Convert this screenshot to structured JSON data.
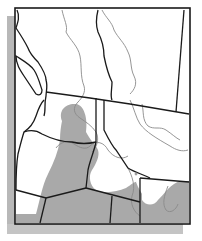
{
  "map": {
    "type": "species-range-map",
    "region": "Northwestern North America",
    "colors": {
      "background": "#ffffff",
      "frame": "#1a1a1a",
      "shadow": "#b4b4b4",
      "range_fill": "#a9a9a9",
      "political_border": "#1a1a1a",
      "river": "#8a8a8a"
    },
    "legend": null,
    "labels": []
  }
}
